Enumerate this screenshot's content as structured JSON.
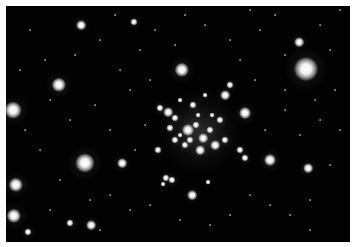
{
  "image": {
    "subject": "star cluster",
    "palette": {
      "background": "#020202",
      "border": "#ffffff",
      "star": "#ffffff"
    },
    "cluster_glow": {
      "x": 200,
      "y": 132,
      "r": 42
    },
    "bright_stars": [
      {
        "x": 13,
        "y": 110,
        "r": 7
      },
      {
        "x": 59,
        "y": 85,
        "r": 6
      },
      {
        "x": 85,
        "y": 163,
        "r": 8
      },
      {
        "x": 16,
        "y": 185,
        "r": 6
      },
      {
        "x": 14,
        "y": 216,
        "r": 6
      },
      {
        "x": 306,
        "y": 69,
        "r": 10
      },
      {
        "x": 182,
        "y": 70,
        "r": 6
      },
      {
        "x": 245,
        "y": 113,
        "r": 5
      },
      {
        "x": 270,
        "y": 160,
        "r": 5
      },
      {
        "x": 81,
        "y": 25,
        "r": 4
      },
      {
        "x": 91,
        "y": 225,
        "r": 4
      },
      {
        "x": 70,
        "y": 223,
        "r": 3
      },
      {
        "x": 299,
        "y": 42,
        "r": 4
      },
      {
        "x": 308,
        "y": 168,
        "r": 4
      },
      {
        "x": 192,
        "y": 195,
        "r": 4
      },
      {
        "x": 122,
        "y": 163,
        "r": 4
      },
      {
        "x": 28,
        "y": 232,
        "r": 3
      },
      {
        "x": 134,
        "y": 22,
        "r": 3
      }
    ],
    "cluster_stars": [
      {
        "x": 168,
        "y": 112,
        "r": 4
      },
      {
        "x": 175,
        "y": 118,
        "r": 3
      },
      {
        "x": 188,
        "y": 130,
        "r": 5
      },
      {
        "x": 196,
        "y": 125,
        "r": 3
      },
      {
        "x": 203,
        "y": 138,
        "r": 4
      },
      {
        "x": 210,
        "y": 130,
        "r": 3
      },
      {
        "x": 215,
        "y": 145,
        "r": 4
      },
      {
        "x": 200,
        "y": 150,
        "r": 4
      },
      {
        "x": 185,
        "y": 145,
        "r": 3
      },
      {
        "x": 175,
        "y": 140,
        "r": 3
      },
      {
        "x": 170,
        "y": 128,
        "r": 3
      },
      {
        "x": 220,
        "y": 120,
        "r": 3
      },
      {
        "x": 225,
        "y": 95,
        "r": 4
      },
      {
        "x": 230,
        "y": 85,
        "r": 3
      },
      {
        "x": 160,
        "y": 108,
        "r": 3
      },
      {
        "x": 193,
        "y": 105,
        "r": 3
      },
      {
        "x": 205,
        "y": 95,
        "r": 2
      },
      {
        "x": 180,
        "y": 100,
        "r": 2
      },
      {
        "x": 158,
        "y": 150,
        "r": 3
      },
      {
        "x": 166,
        "y": 178,
        "r": 3
      },
      {
        "x": 172,
        "y": 180,
        "r": 3
      },
      {
        "x": 163,
        "y": 184,
        "r": 2
      },
      {
        "x": 208,
        "y": 182,
        "r": 2
      },
      {
        "x": 240,
        "y": 150,
        "r": 3
      },
      {
        "x": 245,
        "y": 158,
        "r": 3
      },
      {
        "x": 225,
        "y": 140,
        "r": 3
      },
      {
        "x": 212,
        "y": 115,
        "r": 2
      },
      {
        "x": 190,
        "y": 140,
        "r": 3
      },
      {
        "x": 180,
        "y": 135,
        "r": 2
      },
      {
        "x": 198,
        "y": 115,
        "r": 2
      }
    ],
    "faint_stars": [
      {
        "x": 30,
        "y": 30
      },
      {
        "x": 45,
        "y": 60
      },
      {
        "x": 100,
        "y": 40
      },
      {
        "x": 120,
        "y": 70
      },
      {
        "x": 140,
        "y": 50
      },
      {
        "x": 155,
        "y": 30
      },
      {
        "x": 175,
        "y": 45
      },
      {
        "x": 205,
        "y": 25
      },
      {
        "x": 230,
        "y": 40
      },
      {
        "x": 240,
        "y": 60
      },
      {
        "x": 260,
        "y": 30
      },
      {
        "x": 275,
        "y": 15
      },
      {
        "x": 285,
        "y": 55
      },
      {
        "x": 320,
        "y": 25
      },
      {
        "x": 330,
        "y": 50
      },
      {
        "x": 335,
        "y": 90
      },
      {
        "x": 320,
        "y": 120
      },
      {
        "x": 300,
        "y": 135
      },
      {
        "x": 285,
        "y": 110
      },
      {
        "x": 330,
        "y": 165
      },
      {
        "x": 310,
        "y": 200
      },
      {
        "x": 290,
        "y": 215
      },
      {
        "x": 270,
        "y": 205
      },
      {
        "x": 250,
        "y": 195
      },
      {
        "x": 230,
        "y": 215
      },
      {
        "x": 210,
        "y": 225
      },
      {
        "x": 180,
        "y": 220
      },
      {
        "x": 150,
        "y": 205
      },
      {
        "x": 130,
        "y": 210
      },
      {
        "x": 110,
        "y": 195
      },
      {
        "x": 90,
        "y": 200
      },
      {
        "x": 60,
        "y": 180
      },
      {
        "x": 40,
        "y": 150
      },
      {
        "x": 25,
        "y": 130
      },
      {
        "x": 70,
        "y": 120
      },
      {
        "x": 95,
        "y": 105
      },
      {
        "x": 110,
        "y": 130
      },
      {
        "x": 130,
        "y": 90
      },
      {
        "x": 150,
        "y": 80
      },
      {
        "x": 145,
        "y": 125
      },
      {
        "x": 135,
        "y": 150
      },
      {
        "x": 255,
        "y": 80
      },
      {
        "x": 265,
        "y": 130
      },
      {
        "x": 285,
        "y": 90
      },
      {
        "x": 315,
        "y": 100
      },
      {
        "x": 340,
        "y": 130
      },
      {
        "x": 50,
        "y": 100
      },
      {
        "x": 20,
        "y": 70
      },
      {
        "x": 75,
        "y": 55
      },
      {
        "x": 115,
        "y": 15
      },
      {
        "x": 185,
        "y": 15
      },
      {
        "x": 250,
        "y": 10
      },
      {
        "x": 340,
        "y": 10
      },
      {
        "x": 310,
        "y": 230
      },
      {
        "x": 50,
        "y": 210
      },
      {
        "x": 100,
        "y": 230
      }
    ]
  }
}
